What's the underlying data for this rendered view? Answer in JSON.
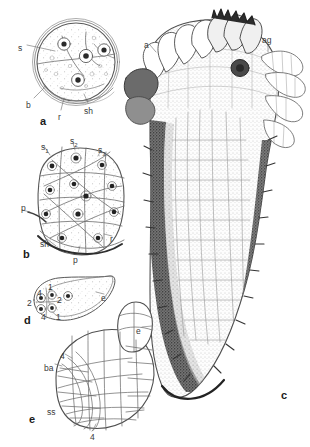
{
  "figure": {
    "kind": "scientific-plate",
    "background": "#ffffff",
    "ink": "#3a3a3a",
    "panels": [
      {
        "id": "a",
        "letter": "a",
        "letter_pos": [
          40,
          116
        ],
        "caption": "zygote / single cell in section with four nuclei and dividing walls",
        "labels": [
          {
            "text": "s",
            "x": 18,
            "y": 44
          },
          {
            "text": "b",
            "x": 26,
            "y": 101
          },
          {
            "text": "r",
            "x": 58,
            "y": 113
          },
          {
            "text": "sh",
            "x": 84,
            "y": 107
          }
        ]
      },
      {
        "id": "b",
        "letter": "b",
        "letter_pos": [
          23,
          249
        ],
        "caption": "multicellular proembryo with nucleated cells",
        "labels": [
          {
            "text": "s",
            "sub": "1",
            "x": 41,
            "y": 143
          },
          {
            "text": "s",
            "sub": "2",
            "x": 70,
            "y": 137
          },
          {
            "text": "s",
            "sub": "3",
            "x": 98,
            "y": 146
          },
          {
            "text": "p",
            "x": 21,
            "y": 204
          },
          {
            "text": "sh",
            "x": 40,
            "y": 240
          },
          {
            "text": "p",
            "x": 73,
            "y": 256
          },
          {
            "text": "r",
            "x": 110,
            "y": 235
          }
        ]
      },
      {
        "id": "c",
        "letter": "c",
        "letter_pos": [
          281,
          390
        ],
        "caption": "longitudinal section of mature embryo showing apical lobes, dark cortical bands and central procambial strand",
        "labels": [
          {
            "text": "a",
            "x": 144,
            "y": 41
          },
          {
            "text": "ag",
            "x": 262,
            "y": 36
          }
        ]
      },
      {
        "id": "d",
        "letter": "d",
        "letter_pos": [
          24,
          315
        ],
        "caption": "early embryo in section with numbered cell tiers",
        "labels": [
          {
            "text": "4",
            "x": 37,
            "y": 289
          },
          {
            "text": "1",
            "x": 48,
            "y": 283
          },
          {
            "text": "2",
            "x": 27,
            "y": 299
          },
          {
            "text": "2",
            "x": 57,
            "y": 296
          },
          {
            "text": "4",
            "x": 41,
            "y": 313
          },
          {
            "text": "1",
            "x": 56,
            "y": 313
          },
          {
            "text": "e",
            "x": 101,
            "y": 294
          }
        ]
      },
      {
        "id": "e",
        "letter": "e",
        "letter_pos": [
          29,
          414
        ],
        "caption": "later embryo with polygonal cell network, basal and suspensor regions",
        "labels": [
          {
            "text": "e",
            "x": 136,
            "y": 327
          },
          {
            "text": "4",
            "x": 60,
            "y": 352
          },
          {
            "text": "ba",
            "x": 44,
            "y": 364
          },
          {
            "text": "ss",
            "x": 47,
            "y": 408
          },
          {
            "text": "4",
            "x": 90,
            "y": 433
          }
        ]
      }
    ]
  }
}
